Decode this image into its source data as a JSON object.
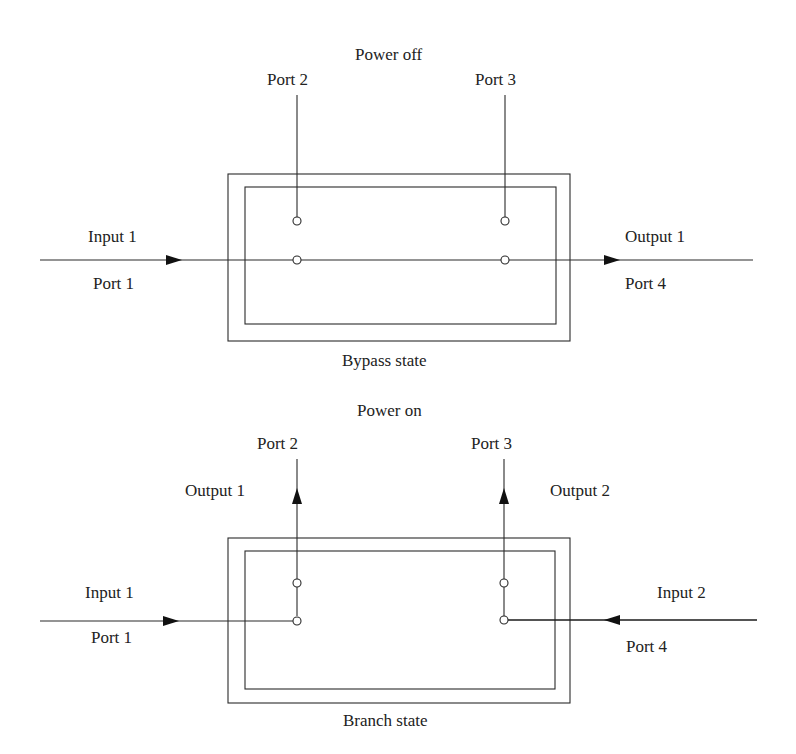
{
  "diagrams": [
    {
      "id": "bypass",
      "power_label": "Power off",
      "state_label": "Bypass state",
      "ports": {
        "port1": "Port 1",
        "port2": "Port 2",
        "port3": "Port 3",
        "port4": "Port 4"
      },
      "signals": {
        "left_in": "Input 1",
        "right_out": "Output 1"
      }
    },
    {
      "id": "branch",
      "power_label": "Power on",
      "state_label": "Branch state",
      "ports": {
        "port1": "Port 1",
        "port2": "Port 2",
        "port3": "Port 3",
        "port4": "Port 4"
      },
      "signals": {
        "left_in": "Input 1",
        "right_in": "Input 2",
        "up_left_out": "Output 1",
        "up_right_out": "Output 2"
      }
    }
  ]
}
